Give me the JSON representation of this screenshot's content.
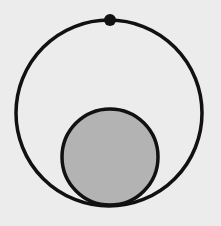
{
  "diagram": {
    "background": "#ececec",
    "stroke_color": "#111111",
    "outer_circle": {
      "cx": 109,
      "cy": 113,
      "r": 93,
      "fill": "none",
      "stroke_width": 3.5
    },
    "inner_circle": {
      "cx": 110,
      "cy": 157,
      "r": 48,
      "fill": "#b3b3b3",
      "stroke_width": 3.5
    },
    "point": {
      "cx": 110,
      "cy": 20,
      "r": 6,
      "fill": "#111111"
    }
  }
}
